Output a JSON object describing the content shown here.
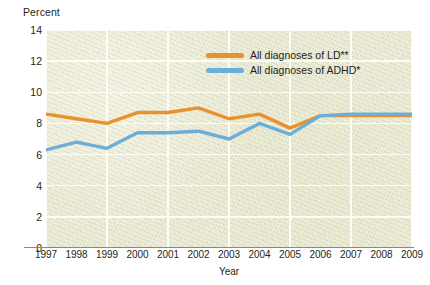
{
  "chart_data": {
    "type": "line",
    "title": "",
    "ylabel": "Percent",
    "xlabel": "Year",
    "categories": [
      "1997",
      "1998",
      "1999",
      "2000",
      "2001",
      "2002",
      "2003",
      "2004",
      "2005",
      "2006",
      "2007",
      "2008",
      "2009"
    ],
    "x": [
      1997,
      1998,
      1999,
      2000,
      2001,
      2002,
      2003,
      2004,
      2005,
      2006,
      2007,
      2008,
      2009
    ],
    "ylim": [
      0,
      14
    ],
    "xlim": [
      1997,
      2009
    ],
    "yticks": [
      0,
      2,
      4,
      6,
      8,
      10,
      12,
      14
    ],
    "ytick_labels": [
      "0",
      "2",
      "4",
      "6",
      "8",
      "10",
      "12",
      "14"
    ],
    "grid": true,
    "legend_position": "upper-center",
    "series": [
      {
        "name": "All diagnoses of LD**",
        "color": "#e8922e",
        "values": [
          8.6,
          8.3,
          8.0,
          8.7,
          8.7,
          9.0,
          8.3,
          8.6,
          7.7,
          8.5,
          8.5,
          8.5,
          8.5
        ]
      },
      {
        "name": "All diagnoses of ADHD*",
        "color": "#6caeda",
        "values": [
          6.3,
          6.8,
          6.4,
          7.4,
          7.4,
          7.5,
          7.0,
          8.0,
          7.3,
          8.5,
          8.6,
          8.6,
          8.6
        ]
      }
    ]
  },
  "axes": {
    "y_caption": "Percent",
    "x_caption": "Year"
  },
  "legend": {
    "items": [
      {
        "label": "All diagnoses of LD**",
        "color": "#e8922e"
      },
      {
        "label": "All diagnoses of ADHD*",
        "color": "#6caeda"
      }
    ]
  },
  "colors": {
    "plot_background": "#e8e8d1",
    "gridline": "#fdfdf6",
    "page_background": "#ffffff",
    "text": "#231f20",
    "series_ld": "#e8922e",
    "series_adhd": "#6caeda"
  }
}
